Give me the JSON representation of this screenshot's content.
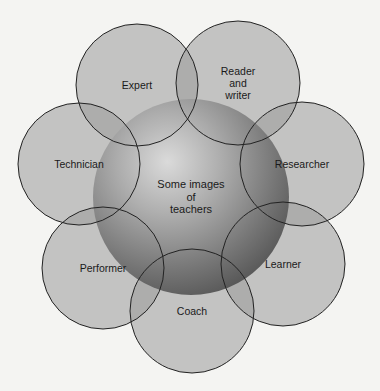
{
  "diagram": {
    "center": {
      "label": "Some images\nof\nteachers",
      "cx": 191,
      "cy": 197,
      "r": 98
    },
    "nodes": [
      {
        "id": "expert",
        "label": "Expert",
        "cx": 137,
        "cy": 85,
        "r": 61
      },
      {
        "id": "reader-writer",
        "label": "Reader\nand\nwriter",
        "cx": 238,
        "cy": 83,
        "r": 62
      },
      {
        "id": "technician",
        "label": "Technician",
        "cx": 79,
        "cy": 164,
        "r": 61
      },
      {
        "id": "researcher",
        "label": "Researcher",
        "cx": 302,
        "cy": 164,
        "r": 62
      },
      {
        "id": "performer",
        "label": "Performer",
        "cx": 103,
        "cy": 268,
        "r": 61
      },
      {
        "id": "learner",
        "label": "Learner",
        "cx": 283,
        "cy": 264,
        "r": 62
      },
      {
        "id": "coach",
        "label": "Coach",
        "cx": 192,
        "cy": 311,
        "r": 62
      }
    ],
    "colors": {
      "circle_fill": "#9a9a9a",
      "stroke": "#222222",
      "background": "#f4f4f2"
    }
  }
}
